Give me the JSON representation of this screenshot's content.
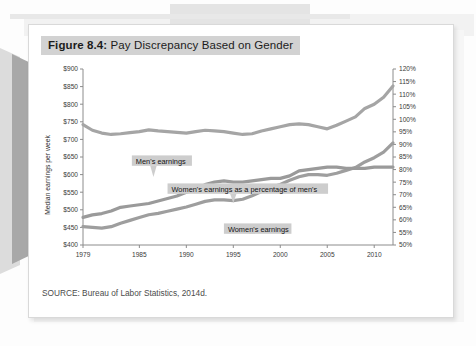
{
  "figure": {
    "number_label": "Figure 8.4:",
    "title_text": " Pay Discrepancy Based on Gender",
    "source": "SOURCE: Bureau of Labor Statistics, 2014d."
  },
  "colors": {
    "title_highlight": "#d2d2d2",
    "annotation_highlight": "#cdcdcd",
    "mens_line": "#a5a5a5",
    "womens_line": "#9e9e9e",
    "percentage_line": "#9a9a9a",
    "axis": "#8c8c8c",
    "card_background": "#ffffff",
    "page_background": "#f6f6f6"
  },
  "chart_data": {
    "type": "line",
    "title": "Figure 8.4: Pay Discrepancy Based on Gender",
    "xlabel": "",
    "ylabel": "Median earnings per week",
    "y2label": "",
    "xlim": [
      1979,
      2012
    ],
    "ylim": [
      400,
      900
    ],
    "y2lim": [
      50,
      120
    ],
    "grid": false,
    "legend_position": "inline-annotations",
    "x_tick_labels": [
      "1979",
      "1985",
      "1990",
      "1995",
      "2000",
      "2005",
      "2010"
    ],
    "x_ticks": [
      1979,
      1985,
      1990,
      1995,
      2000,
      2005,
      2010
    ],
    "y_tick_labels": [
      "$400",
      "$450",
      "$500",
      "$550",
      "$600",
      "$650",
      "$700",
      "$750",
      "$800",
      "$850",
      "$900"
    ],
    "y_ticks": [
      400,
      450,
      500,
      550,
      600,
      650,
      700,
      750,
      800,
      850,
      900
    ],
    "y2_tick_labels": [
      "50%",
      "55%",
      "60%",
      "65%",
      "70%",
      "75%",
      "80%",
      "85%",
      "90%",
      "95%",
      "100%",
      "105%",
      "110%",
      "115%",
      "120%"
    ],
    "y2_ticks": [
      50,
      55,
      60,
      65,
      70,
      75,
      80,
      85,
      90,
      95,
      100,
      105,
      110,
      115,
      120
    ],
    "x": [
      1979,
      1980,
      1981,
      1982,
      1983,
      1984,
      1985,
      1986,
      1987,
      1988,
      1989,
      1990,
      1991,
      1992,
      1993,
      1994,
      1995,
      1996,
      1997,
      1998,
      1999,
      2000,
      2001,
      2002,
      2003,
      2004,
      2005,
      2006,
      2007,
      2008,
      2009,
      2010,
      2011,
      2012
    ],
    "series": [
      {
        "name": "Men's earnings",
        "axis": "left",
        "unit": "dollars per week",
        "annotation": "Men's earnings",
        "values": [
          742,
          726,
          718,
          714,
          716,
          719,
          722,
          727,
          724,
          722,
          720,
          718,
          722,
          726,
          724,
          722,
          718,
          714,
          716,
          724,
          730,
          736,
          742,
          744,
          742,
          736,
          730,
          740,
          752,
          764,
          788,
          800,
          820,
          852
        ]
      },
      {
        "name": "Women's earnings",
        "axis": "left",
        "unit": "dollars per week",
        "annotation": "Women's earnings",
        "values": [
          452,
          450,
          448,
          452,
          462,
          470,
          478,
          486,
          490,
          496,
          502,
          508,
          516,
          524,
          528,
          528,
          526,
          530,
          540,
          552,
          564,
          572,
          584,
          594,
          600,
          600,
          598,
          604,
          612,
          620,
          636,
          648,
          664,
          690
        ]
      },
      {
        "name": "Women's earnings as a percentage of men's",
        "axis": "right",
        "unit": "percent",
        "annotation": "Women's earnings as a percentage of men's",
        "values": [
          61.0,
          62.0,
          62.5,
          63.5,
          65.0,
          65.5,
          66.0,
          66.5,
          67.5,
          68.5,
          69.5,
          71.0,
          72.0,
          74.0,
          75.0,
          75.5,
          75.0,
          75.0,
          75.5,
          76.0,
          76.5,
          76.5,
          77.5,
          79.5,
          80.0,
          80.5,
          81.0,
          81.0,
          80.5,
          80.5,
          80.5,
          81.0,
          81.0,
          81.0
        ]
      }
    ]
  }
}
